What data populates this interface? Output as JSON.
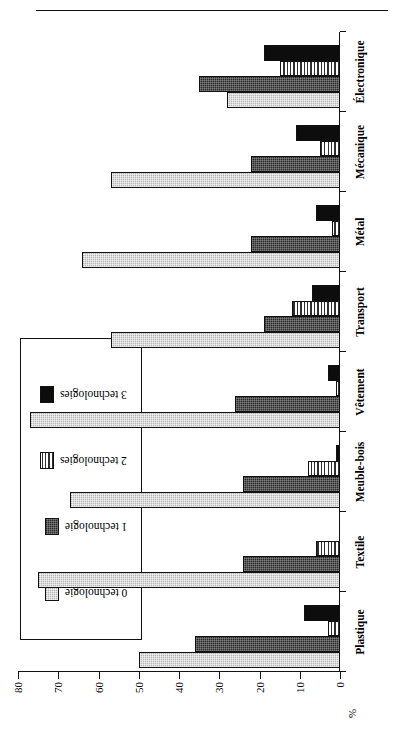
{
  "chart_data": {
    "type": "bar",
    "orientation": "rotated-90",
    "title": "",
    "xlabel": "",
    "ylabel": "%",
    "ylim": [
      0,
      80
    ],
    "yticks": [
      0,
      10,
      20,
      30,
      40,
      50,
      60,
      70,
      80
    ],
    "grid": false,
    "legend_position": "inside-upper-left",
    "categories": [
      "Plastique",
      "Textile",
      "Meuble-bois",
      "Vêtement",
      "Transport",
      "Métal",
      "Mécanique",
      "Électronique"
    ],
    "series": [
      {
        "name": "0 technologie",
        "values": [
          50,
          75,
          67,
          77,
          57,
          64,
          57,
          28
        ]
      },
      {
        "name": "1 technologie",
        "values": [
          36,
          24,
          24,
          26,
          19,
          22,
          22,
          35
        ]
      },
      {
        "name": "2 technologies",
        "values": [
          3,
          6,
          8,
          1,
          12,
          2,
          5,
          15
        ]
      },
      {
        "name": "3 technologies",
        "values": [
          9,
          0,
          1,
          3,
          7,
          6,
          11,
          19
        ]
      }
    ]
  },
  "axis": {
    "value_caption": "%",
    "tick_labels": [
      "0",
      "10",
      "20",
      "30",
      "40",
      "50",
      "60",
      "70",
      "80"
    ]
  },
  "legend": {
    "items": [
      {
        "label": "0 technologie"
      },
      {
        "label": "1 technologie"
      },
      {
        "label": "2 technologies"
      },
      {
        "label": "3 technologies"
      }
    ]
  },
  "categories_labels": {
    "c0": "Plastique",
    "c1": "Textile",
    "c2": "Meuble-bois",
    "c3": "Vêtement",
    "c4": "Transport",
    "c5": "Métal",
    "c6": "Mécanique",
    "c7": "Électronique"
  }
}
